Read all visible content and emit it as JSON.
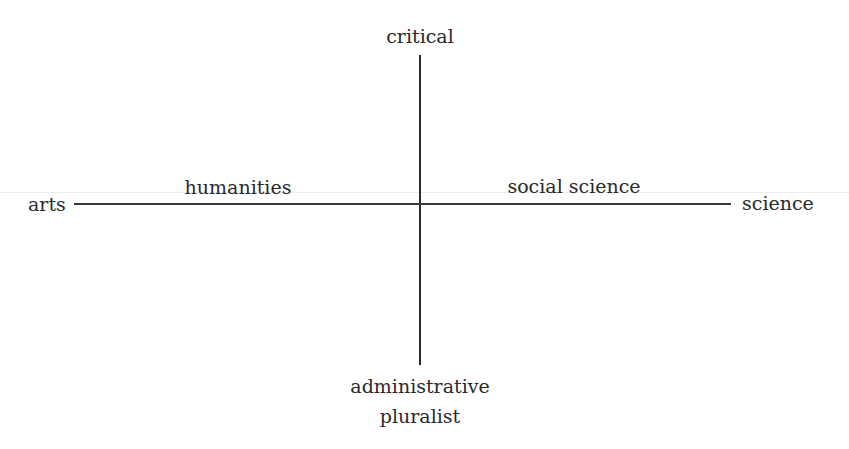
{
  "diagram": {
    "type": "quadrant-axes",
    "axes": {
      "vertical": {
        "top_label": "critical",
        "bottom_label_line1": "administrative",
        "bottom_label_line2": "pluralist"
      },
      "horizontal": {
        "left_label": "arts",
        "right_label": "science"
      }
    },
    "region_labels": {
      "left": "humanities",
      "right": "social science"
    },
    "colors": {
      "line": "#2a2a2a",
      "text": "#2a2a2a",
      "background": "#ffffff"
    }
  }
}
